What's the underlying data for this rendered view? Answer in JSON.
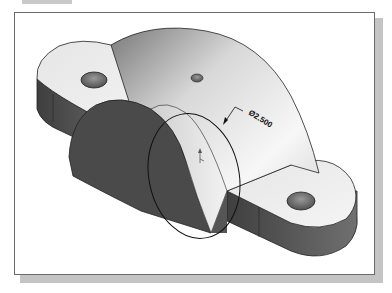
{
  "figure": {
    "dimension": {
      "label": "Ø2.500",
      "type": "diameter"
    },
    "colors": {
      "frame_border": "#6a6a6a",
      "frame_shadow": "#c4c4c4",
      "dark_face": "#4a4a4a",
      "light_face": "#ececec",
      "edge": "#222222"
    }
  }
}
